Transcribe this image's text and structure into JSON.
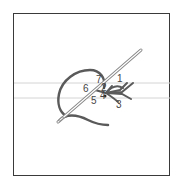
{
  "diagram": {
    "labels": [
      {
        "id": "1",
        "text": "1",
        "x": 118,
        "y": 81
      },
      {
        "id": "2",
        "text": "2",
        "x": 102,
        "y": 88
      },
      {
        "id": "3",
        "text": "3",
        "x": 117,
        "y": 106
      },
      {
        "id": "4",
        "text": "4",
        "x": 103,
        "y": 97
      },
      {
        "id": "5",
        "text": "5",
        "x": 92,
        "y": 102
      },
      {
        "id": "6",
        "text": "6",
        "x": 84,
        "y": 91
      },
      {
        "id": "7",
        "text": "7",
        "x": 97,
        "y": 82
      }
    ],
    "colors": {
      "frame": "#3a3a3a",
      "thread": "#5a5a5a",
      "guide_lines": "#d4d4d4",
      "needle": "#888888",
      "label": "#444444"
    }
  }
}
